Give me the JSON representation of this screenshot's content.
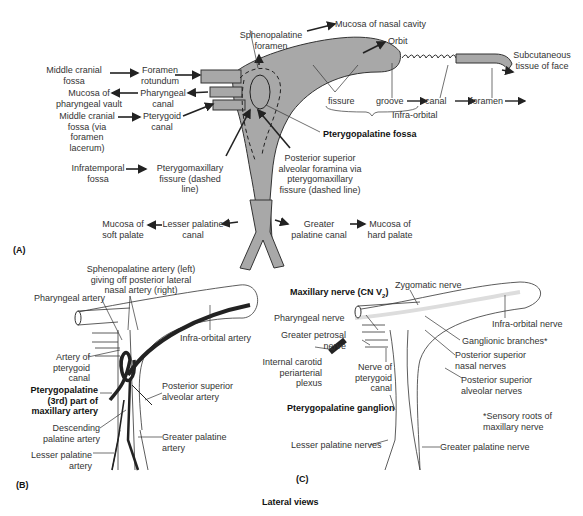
{
  "panelA": {
    "panel_label": "(A)",
    "labels": {
      "middle_cranial_fossa_1": "Middle cranial fossa",
      "foramen_rotundum": "Foramen rotundum",
      "mucosa_pharyngeal_vault": "Mucosa of pharyngeal vault",
      "pharyngeal_canal": "Pharyngeal canal",
      "middle_cranial_fossa_2": "Middle cranial fossa (via foramen lacerum)",
      "pterygoid_canal": "Pterygoid canal",
      "sphenopalatine_foramen": "Sphenopalatine foramen",
      "mucosa_nasal_cavity": "Mucosa of nasal cavity",
      "orbit": "Orbit",
      "subcutaneous": "Subcutaneous tissue of face",
      "fissure": "fissure",
      "groove": "groove",
      "canal": "canal",
      "foramen": "foramen",
      "infra_orbital": "Infra-orbital",
      "pterygopalatine_fossa": "Pterygopalatine fossa",
      "infratemporal_fossa": "Infratemporal fossa",
      "pterygomaxillary_fissure": "Pterygomaxillary fissure (dashed line)",
      "posterior_superior_alveolar": "Posterior superior alveolar foramina via pterygomaxillary fissure (dashed line)",
      "mucosa_soft_palate": "Mucosa of soft palate",
      "lesser_palatine_canal": "Lesser palatine canal",
      "greater_palatine_canal": "Greater palatine canal",
      "mucosa_hard_palate": "Mucosa of hard palate"
    }
  },
  "panelB": {
    "panel_label": "(B)",
    "labels": {
      "sphenopalatine_artery": "Sphenopalatine artery (left) giving off posterior lateral nasal artery (right)",
      "pharyngeal_artery": "Pharyngeal artery",
      "infra_orbital_artery": "Infra-orbital artery",
      "artery_pterygoid_canal": "Artery of pterygoid canal",
      "pterygopalatine_part": "Pterygopalatine (3rd) part of maxillary artery",
      "posterior_superior_alveolar_artery": "Posterior superior alveolar artery",
      "descending_palatine": "Descending palatine artery",
      "greater_palatine_artery": "Greater palatine artery",
      "lesser_palatine_artery": "Lesser palatine artery"
    }
  },
  "panelC": {
    "panel_label": "(C)",
    "labels": {
      "zygomatic_nerve": "Zygomatic nerve",
      "maxillary_nerve": "Maxillary nerve (CN V",
      "maxillary_nerve_sub": "2",
      "maxillary_nerve_end": ")",
      "pharyngeal_nerve": "Pharyngeal nerve",
      "infra_orbital_nerve": "Infra-orbital nerve",
      "greater_petrosal": "Greater petrosal nerve",
      "ganglionic_branches": "Ganglionic branches*",
      "internal_carotid": "Internal carotid periarterial plexus",
      "nerve_pterygoid_canal": "Nerve of pterygoid canal",
      "posterior_superior_nasal": "Posterior superior nasal nerves",
      "posterior_superior_alveolar_nerves": "Posterior superior alveolar nerves",
      "pterygopalatine_ganglion": "Pterygopalatine ganglion",
      "sensory_roots": "*Sensory roots of maxillary nerve",
      "lesser_palatine_nerves": "Lesser palatine nerves",
      "greater_palatine_nerve": "Greater palatine nerve"
    }
  },
  "caption": "Lateral views",
  "colors": {
    "fossa_fill": "#a8a8a8",
    "artery": "#222222",
    "outline": "#333333"
  }
}
